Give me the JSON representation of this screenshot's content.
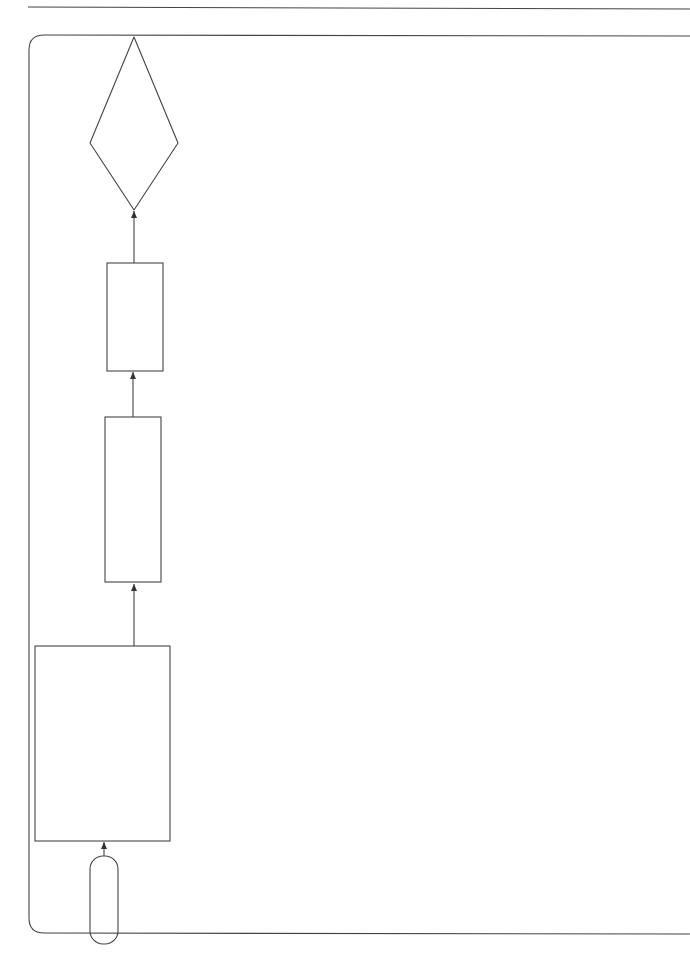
{
  "page": {
    "caption_line1": "Flow chart 35   Sheet 1 of 2",
    "caption_line2": "Take over"
  },
  "terminals": {
    "start": "Start",
    "finish": "Finish"
  },
  "headings": {
    "completion": "COMPLETION",
    "completion_date": "COMPLETION DATE",
    "the_parties": "THE PARTIES",
    "take_over": "TAKE OVER?",
    "completion_certified_1": "COMPLETION",
    "completion_certified_2": "CERTIFIED?",
    "employer_using_1": "EMPLOYER USING",
    "employer_using_2": "THE WORKS?",
    "reason_wi_1": "REASON STATED IN",
    "reason_wi_2": "WORKS INFORMATION?",
    "reason_contractor_1": "REASON TO SUIT",
    "reason_contractor_2": "CONTRACTOR?",
    "employer_takes_over_1": "EMPLOYER TAKES OVER",
    "employer_takes_over_2": "WHEN HIS USE BEGINS"
  },
  "boxes": {
    "completion": {
      "ref": "11.2(2)",
      "intro": "Completion is when the C has",
      "bullet1_a": "done all the work which the WI states",
      "bullet1_b": "he is to do by the Completion Date and",
      "bullet2_a": "corrected notified Defects which",
      "bullet2_b": "would have prevented the E from",
      "bullet2_c": "using the works and Others from doing",
      "bullet2_d": "their work.",
      "para2_a": "If the work which the C is to do by the",
      "para2_b": "Completion Date is not stated in the WI,",
      "para2_c": "Completion is when the C has done all",
      "para2_d": "the work necessary for the E to use the",
      "para2_e": "works and for Others to do their work."
    },
    "completion_date": {
      "ref": "11.2(3)",
      "line1": "The Completion Date is the completion",
      "line2": "date unless later changed in accordance",
      "line3": "with this contract."
    },
    "the_parties": {
      "ref": "11.2(11)",
      "line1": "The Parties are the Employer",
      "line2": "and the Contractor."
    },
    "e_may_use": {
      "ref": "35.2",
      "line1": "The E may use any part of the",
      "line2": "works before Completion has",
      "line3": "been certified."
    },
    "e_takes_over": {
      "ref": "35.2",
      "line1": "The E takes over the part of",
      "line2": "works when he starts using it."
    },
    "e_not_take_over": {
      "line1": "The E does not take",
      "line2": "over the whole or a",
      "line3": "part of the works."
    }
  },
  "decisions": {
    "take_over": {
      "line1": "Does one of",
      "line2": "the Parties wish the E",
      "line3": "to take over or use the",
      "line4": "whole or a part of",
      "line5": "the works?",
      "yes": "YES",
      "no": "NO"
    },
    "certified": {
      "line1": "Has the PM",
      "line2": "certified Completion of the",
      "line3": "whole or a part of",
      "line4": "the works?",
      "yes": "YES",
      "no": "NO"
    },
    "employer_using": {
      "ref": "35.2",
      "line1": "Does the E",
      "line2": "use any part of",
      "line3": "the works?",
      "yes": "YES",
      "no": "NO"
    },
    "reason_wi": {
      "ref": "35.2",
      "line1": "Is the use",
      "line2": "for a reason stated",
      "line3": "in the WI?",
      "yes": "YES",
      "no": "NO"
    },
    "reason_contractor": {
      "ref": "35.2",
      "line1": "Is the use to",
      "line2": "suit the C's method",
      "line3": "of working?",
      "yes": "YES",
      "no": "NO"
    }
  },
  "connectors": {
    "a": {
      "letter": "A",
      "word": "sheet",
      "num": "2"
    },
    "b": {
      "letter": "B",
      "word": "sheet",
      "num": "2"
    }
  }
}
